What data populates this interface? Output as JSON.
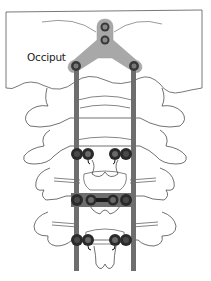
{
  "figure": {
    "labels": {
      "occiput": "Occiput"
    },
    "colors": {
      "bone_outline": "#333333",
      "plate": "#a8a8a8",
      "rod": "#6e6e6e",
      "screw_dark": "#2a2a2a",
      "screw_head": "#4a4a4a",
      "background": "#ffffff"
    },
    "components": {
      "occipital_plate": "Y-shaped plate with 2 midline screws and 2 lateral rod connectors",
      "rods": 2,
      "screw_levels": 3,
      "cross_connector_level": 2
    }
  }
}
